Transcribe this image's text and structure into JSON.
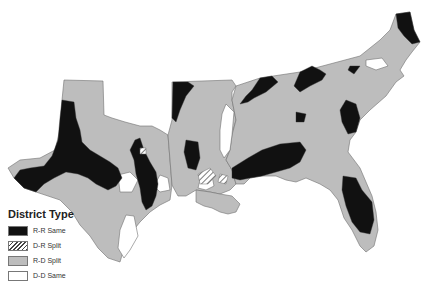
{
  "legend": {
    "title": "District Type",
    "items": [
      {
        "label": "R-R Same",
        "fill": "#111111",
        "pattern": "solid"
      },
      {
        "label": "D-R Split",
        "fill": "#ffffff",
        "pattern": "hatch"
      },
      {
        "label": "R-D Split",
        "fill": "#bdbdbd",
        "pattern": "solid"
      },
      {
        "label": "D-D Same",
        "fill": "#ffffff",
        "pattern": "solid"
      }
    ]
  },
  "colors": {
    "rr_same": "#111111",
    "rd_split": "#bdbdbd",
    "dd_same": "#ffffff",
    "border": "#707070"
  },
  "caption": "Source: ... (partially cut off, illegible)"
}
